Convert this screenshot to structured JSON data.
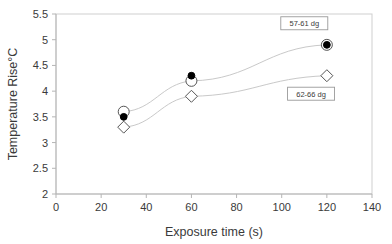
{
  "chart_data": {
    "type": "scatter",
    "title": "",
    "xlabel": "Exposure time (s)",
    "ylabel": "Temperature Rise°C",
    "xlim": [
      0,
      140
    ],
    "ylim": [
      2,
      5.5
    ],
    "xticks": [
      "0",
      "20",
      "40",
      "60",
      "80",
      "100",
      "120",
      "140"
    ],
    "xtick_values": [
      0,
      20,
      40,
      60,
      80,
      100,
      120,
      140
    ],
    "yticks": [
      "2",
      "2.5",
      "3",
      "3.5",
      "4",
      "4.5",
      "5",
      "5.5"
    ],
    "ytick_values": [
      2,
      2.5,
      3,
      3.5,
      4,
      4.5,
      5,
      5.5
    ],
    "grid": false,
    "legend": "annotations",
    "x": [
      30,
      60,
      120
    ],
    "series": [
      {
        "name": "57-61 dg open",
        "marker": "open-circle",
        "values": [
          3.6,
          4.2,
          4.9
        ],
        "connected": true
      },
      {
        "name": "57-61 dg filled",
        "marker": "filled-circle",
        "values": [
          3.5,
          4.3,
          4.9
        ],
        "connected": false
      },
      {
        "name": "62-66 dg",
        "marker": "open-diamond",
        "values": [
          3.3,
          3.9,
          4.3
        ],
        "connected": true
      }
    ],
    "annotations": [
      {
        "text": "57-61 dg",
        "x": 110,
        "y": 5.32
      },
      {
        "text": "62-66 dg",
        "x": 113,
        "y": 3.95
      }
    ],
    "colors": {
      "line": "#c9c9c9",
      "marker_edge": "#555555",
      "marker_fill": "#000000",
      "axis": "#b5b5b5",
      "text": "#3a3a3a",
      "background": "#ffffff",
      "annotation_border": "#9a9a9a"
    }
  }
}
